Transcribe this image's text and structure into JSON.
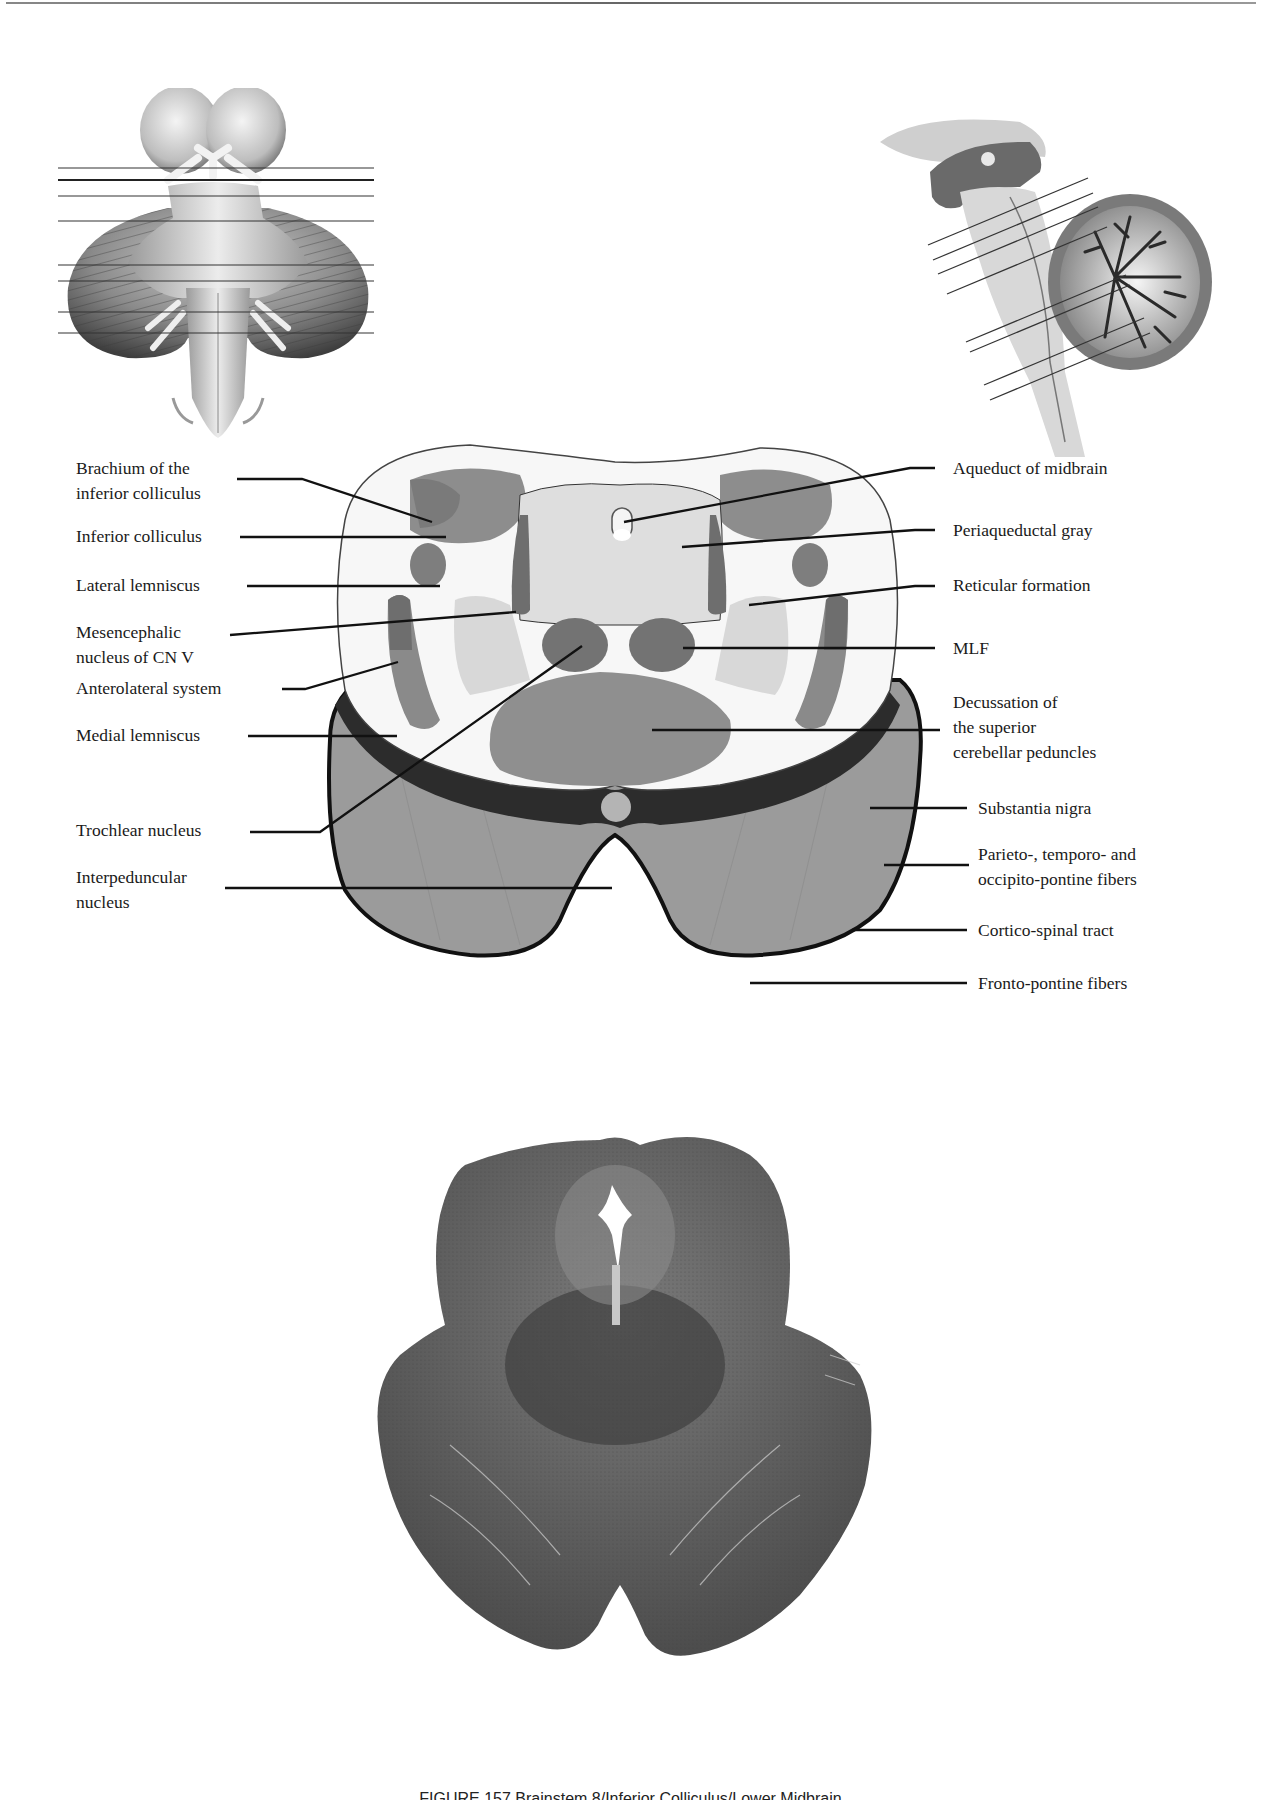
{
  "page": {
    "type": "anatomy-atlas-page",
    "top_rule": true
  },
  "thumbnails": {
    "ventral_brainstem": {
      "name": "ventral-view-brainstem",
      "section_lines": 8,
      "highlighted_line_index": 1
    },
    "midsagittal_brainstem": {
      "name": "midsagittal-view-brainstem-cerebellum",
      "section_lines": 8
    }
  },
  "diagram": {
    "name": "cross-section-midbrain-inferior-colliculus",
    "left_labels": [
      {
        "id": "brachium-inferior-colliculus",
        "lines": [
          "Brachium of the",
          "inferior colliculus"
        ]
      },
      {
        "id": "inferior-colliculus",
        "lines": [
          "Inferior colliculus"
        ]
      },
      {
        "id": "lateral-lemniscus",
        "lines": [
          "Lateral lemniscus"
        ]
      },
      {
        "id": "mesencephalic-nucleus-cn-v",
        "lines": [
          "Mesencephalic",
          "nucleus of CN V"
        ]
      },
      {
        "id": "anterolateral-system",
        "lines": [
          "Anterolateral system"
        ]
      },
      {
        "id": "medial-lemniscus",
        "lines": [
          "Medial lemniscus"
        ]
      },
      {
        "id": "trochlear-nucleus",
        "lines": [
          "Trochlear nucleus"
        ]
      },
      {
        "id": "interpeduncular-nucleus",
        "lines": [
          "Interpeduncular",
          "nucleus"
        ]
      }
    ],
    "right_labels": [
      {
        "id": "aqueduct-of-midbrain",
        "lines": [
          "Aqueduct of midbrain"
        ]
      },
      {
        "id": "periaqueductal-gray",
        "lines": [
          "Periaqueductal gray"
        ]
      },
      {
        "id": "reticular-formation",
        "lines": [
          "Reticular formation"
        ]
      },
      {
        "id": "mlf",
        "lines": [
          "MLF"
        ]
      },
      {
        "id": "decussation-superior-cerebellar-peduncles",
        "lines": [
          "Decussation of",
          "the superior",
          "cerebellar peduncles"
        ]
      },
      {
        "id": "substantia-nigra",
        "lines": [
          "Substantia nigra"
        ]
      },
      {
        "id": "parieto-temporo-occipito-pontine-fibers",
        "lines": [
          "Parieto-, temporo- and",
          "occipito-pontine fibers"
        ]
      },
      {
        "id": "cortico-spinal-tract",
        "lines": [
          "Cortico-spinal tract"
        ]
      },
      {
        "id": "fronto-pontine-fibers",
        "lines": [
          "Fronto-pontine fibers"
        ]
      }
    ],
    "colors": {
      "white_matter": "#f7f7f7",
      "light_gray": "#d9d9d9",
      "mid_gray": "#8c8c8c",
      "dark_gray": "#6e6e6e",
      "peduncle_gray": "#9a9a9a",
      "nigra": "#2b2b2b",
      "leader": "#111111"
    }
  },
  "histology": {
    "name": "stained-section-midbrain",
    "stain_color": "#5e5e5e"
  },
  "caption": {
    "text": "FIGURE 157  Brainstem 8/Inferior Colliculus/Lower Midbrain",
    "clipped": true
  }
}
